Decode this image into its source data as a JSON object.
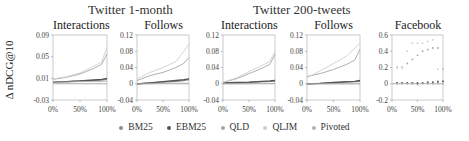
{
  "figure": {
    "y_axis_label": "Δ nDCG@10",
    "group_titles": [
      "Twitter 1-month",
      "Twitter 200-tweets"
    ],
    "legend": [
      {
        "label": "BM25",
        "color": "#8c8c8c"
      },
      {
        "label": "EBM25",
        "color": "#555555"
      },
      {
        "label": "QLD",
        "color": "#a6a6a6"
      },
      {
        "label": "QLJM",
        "color": "#cfcfcf"
      },
      {
        "label": "Pivoted",
        "color": "#b4b4b4"
      }
    ]
  },
  "chart_data": [
    {
      "type": "line",
      "group": "Twitter 1-month",
      "title": "Interactions",
      "xlabel": "",
      "ylabel": "Δ nDCG@10",
      "x_ticks": [
        "0%",
        "50%",
        "100%"
      ],
      "y_ticks": [
        -0.03,
        0.01,
        0.05,
        0.09
      ],
      "ylim": [
        -0.03,
        0.09
      ],
      "x": [
        0,
        25,
        50,
        75,
        90,
        100
      ],
      "series": [
        {
          "name": "BM25",
          "values": [
            0.003,
            0.004,
            0.005,
            0.006,
            0.007,
            0.008
          ]
        },
        {
          "name": "EBM25",
          "values": [
            0.003,
            0.004,
            0.005,
            0.007,
            0.008,
            0.01
          ]
        },
        {
          "name": "QLD",
          "values": [
            0.008,
            0.012,
            0.018,
            0.028,
            0.036,
            0.055
          ]
        },
        {
          "name": "QLJM",
          "values": [
            0.009,
            0.013,
            0.02,
            0.032,
            0.04,
            0.068
          ]
        },
        {
          "name": "Pivoted",
          "values": [
            0.003,
            0.003,
            0.004,
            0.004,
            0.004,
            0.005
          ]
        }
      ]
    },
    {
      "type": "line",
      "group": "Twitter 1-month",
      "title": "Follows",
      "x_ticks": [
        "0%",
        "50%",
        "100%"
      ],
      "y_ticks": [
        -0.04,
        0,
        0.04,
        0.08,
        0.12
      ],
      "ylim": [
        -0.04,
        0.12
      ],
      "x": [
        0,
        25,
        50,
        75,
        90,
        100
      ],
      "series": [
        {
          "name": "BM25",
          "values": [
            0.0,
            0.002,
            0.004,
            0.006,
            0.008,
            0.01
          ]
        },
        {
          "name": "EBM25",
          "values": [
            0.0,
            0.002,
            0.005,
            0.008,
            0.01,
            0.012
          ]
        },
        {
          "name": "QLD",
          "values": [
            0.008,
            0.02,
            0.028,
            0.04,
            0.05,
            0.065
          ]
        },
        {
          "name": "QLJM",
          "values": [
            0.012,
            0.028,
            0.04,
            0.055,
            0.08,
            0.098
          ]
        },
        {
          "name": "Pivoted",
          "values": [
            0.0,
            0.0,
            0.001,
            0.001,
            0.001,
            0.001
          ]
        }
      ]
    },
    {
      "type": "line",
      "group": "Twitter 200-tweets",
      "title": "Interactions",
      "x_ticks": [
        "0%",
        "50%",
        "100%"
      ],
      "y_ticks": [
        -0.04,
        0,
        0.04,
        0.08,
        0.12
      ],
      "ylim": [
        -0.04,
        0.12
      ],
      "x": [
        0,
        25,
        50,
        75,
        90,
        100
      ],
      "series": [
        {
          "name": "BM25",
          "values": [
            0.001,
            0.002,
            0.003,
            0.005,
            0.006,
            0.007
          ]
        },
        {
          "name": "EBM25",
          "values": [
            0.002,
            0.003,
            0.004,
            0.006,
            0.007,
            0.008
          ]
        },
        {
          "name": "QLD",
          "values": [
            0.003,
            0.012,
            0.025,
            0.038,
            0.048,
            0.072
          ]
        },
        {
          "name": "QLJM",
          "values": [
            0.004,
            0.014,
            0.03,
            0.045,
            0.055,
            0.08
          ]
        },
        {
          "name": "Pivoted",
          "values": [
            0.0,
            0.0,
            0.0,
            0.001,
            0.001,
            0.001
          ]
        }
      ]
    },
    {
      "type": "line",
      "group": "Twitter 200-tweets",
      "title": "Follows",
      "x_ticks": [
        "0%",
        "50%",
        "100%"
      ],
      "y_ticks": [
        -0.04,
        0,
        0.04,
        0.08,
        0.12
      ],
      "ylim": [
        -0.04,
        0.12
      ],
      "x": [
        0,
        25,
        50,
        75,
        90,
        100
      ],
      "series": [
        {
          "name": "BM25",
          "values": [
            0.0,
            0.001,
            0.002,
            0.004,
            0.005,
            0.006
          ]
        },
        {
          "name": "EBM25",
          "values": [
            0.0,
            0.001,
            0.003,
            0.005,
            0.006,
            0.008
          ]
        },
        {
          "name": "QLD",
          "values": [
            0.018,
            0.025,
            0.035,
            0.048,
            0.058,
            0.085
          ]
        },
        {
          "name": "QLJM",
          "values": [
            0.015,
            0.032,
            0.05,
            0.068,
            0.088,
            0.1
          ]
        },
        {
          "name": "Pivoted",
          "values": [
            0.0,
            0.0,
            0.0,
            0.0,
            0.0,
            0.0
          ]
        }
      ]
    },
    {
      "type": "scatter",
      "group": "Facebook",
      "title": "Facebook",
      "x_ticks": [
        "0%",
        "50%",
        "100%"
      ],
      "y_ticks": [
        -0.2,
        0,
        0.2,
        0.4,
        0.6
      ],
      "ylim": [
        -0.2,
        0.6
      ],
      "x": [
        10,
        20,
        30,
        40,
        50,
        60,
        70,
        80,
        90,
        100
      ],
      "series": [
        {
          "name": "BM25",
          "values": [
            0.01,
            0.01,
            0.01,
            0.01,
            0.0,
            0.01,
            0.01,
            0.01,
            0.02,
            0.03
          ]
        },
        {
          "name": "EBM25",
          "values": [
            0.01,
            0.01,
            0.01,
            0.01,
            0.01,
            0.01,
            0.02,
            0.02,
            0.03,
            0.03
          ]
        },
        {
          "name": "QLD",
          "values": [
            0.2,
            0.2,
            0.25,
            0.3,
            0.35,
            0.4,
            0.42,
            0.44,
            0.44,
            0.18
          ]
        },
        {
          "name": "QLJM",
          "values": [
            0.2,
            0.2,
            0.4,
            0.5,
            0.5,
            0.5,
            0.52,
            0.54,
            0.18,
            0.18
          ]
        },
        {
          "name": "Pivoted",
          "values": [
            0.0,
            0.0,
            0.0,
            0.0,
            -0.01,
            0.0,
            0.0,
            0.0,
            0.0,
            0.0
          ]
        }
      ]
    }
  ]
}
